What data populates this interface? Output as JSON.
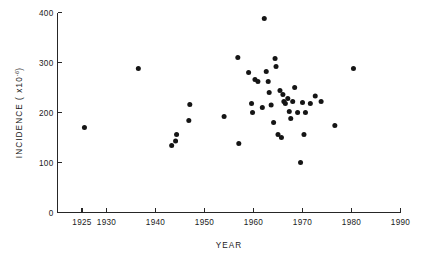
{
  "figure": {
    "background_color": "#ffffff",
    "ink_color": "#1a1a1a",
    "point_color": "#151515"
  },
  "axes": {
    "x": {
      "label": "YEAR",
      "ticks": [
        1925,
        1930,
        1940,
        1950,
        1960,
        1970,
        1980,
        1990
      ],
      "tick_labels": [
        "1925",
        "1930",
        "1940",
        "1950",
        "1960",
        "1970",
        "1980",
        "1990"
      ],
      "range": [
        1920,
        1990
      ]
    },
    "y": {
      "label_prefix": "INCIDENCE ( x10",
      "label_exponent": "-6",
      "label_suffix": ")",
      "label_full": "INCIDENCE ( x10-6 )",
      "ticks": [
        0,
        100,
        200,
        300,
        400
      ],
      "tick_labels": [
        "0",
        "100",
        "200",
        "300",
        "400"
      ],
      "range": [
        0,
        400
      ]
    }
  },
  "chart_data": {
    "type": "scatter",
    "title": "",
    "xlabel": "YEAR",
    "ylabel": "INCIDENCE ( x10-6 )",
    "xlim": [
      1920,
      1990
    ],
    "ylim": [
      0,
      400
    ],
    "grid": false,
    "legend": null,
    "marker": "filled-circle",
    "n_points": 45,
    "x": [
      1925.5,
      1936.5,
      1943.3,
      1944.1,
      1944.3,
      1946.8,
      1947.0,
      1954.0,
      1956.8,
      1957.0,
      1959.0,
      1959.6,
      1959.8,
      1960.3,
      1960.9,
      1961.8,
      1962.2,
      1962.6,
      1963.0,
      1963.2,
      1963.6,
      1964.1,
      1964.4,
      1964.6,
      1965.0,
      1965.4,
      1965.7,
      1966.0,
      1966.2,
      1966.5,
      1967.0,
      1967.3,
      1967.6,
      1968.0,
      1968.4,
      1969.0,
      1969.6,
      1970.0,
      1970.3,
      1970.6,
      1971.6,
      1972.6,
      1973.8,
      1976.6,
      1980.4
    ],
    "y": [
      170,
      288,
      134,
      143,
      156,
      184,
      216,
      192,
      310,
      138,
      280,
      218,
      200,
      266,
      262,
      210,
      388,
      282,
      262,
      240,
      215,
      180,
      308,
      292,
      156,
      244,
      150,
      236,
      222,
      218,
      228,
      202,
      188,
      222,
      250,
      200,
      100,
      220,
      156,
      200,
      218,
      233,
      222,
      174,
      288
    ],
    "points": [
      {
        "year": 1925.5,
        "incidence": 170
      },
      {
        "year": 1936.5,
        "incidence": 288
      },
      {
        "year": 1943.3,
        "incidence": 134
      },
      {
        "year": 1944.1,
        "incidence": 143
      },
      {
        "year": 1944.3,
        "incidence": 156
      },
      {
        "year": 1946.8,
        "incidence": 184
      },
      {
        "year": 1947.0,
        "incidence": 216
      },
      {
        "year": 1954.0,
        "incidence": 192
      },
      {
        "year": 1956.8,
        "incidence": 310
      },
      {
        "year": 1957.0,
        "incidence": 138
      },
      {
        "year": 1959.0,
        "incidence": 280
      },
      {
        "year": 1959.6,
        "incidence": 218
      },
      {
        "year": 1959.8,
        "incidence": 200
      },
      {
        "year": 1960.3,
        "incidence": 266
      },
      {
        "year": 1960.9,
        "incidence": 262
      },
      {
        "year": 1961.8,
        "incidence": 210
      },
      {
        "year": 1962.2,
        "incidence": 388
      },
      {
        "year": 1962.6,
        "incidence": 282
      },
      {
        "year": 1963.0,
        "incidence": 262
      },
      {
        "year": 1963.2,
        "incidence": 240
      },
      {
        "year": 1963.6,
        "incidence": 215
      },
      {
        "year": 1964.1,
        "incidence": 180
      },
      {
        "year": 1964.4,
        "incidence": 308
      },
      {
        "year": 1964.6,
        "incidence": 292
      },
      {
        "year": 1965.0,
        "incidence": 156
      },
      {
        "year": 1965.4,
        "incidence": 244
      },
      {
        "year": 1965.7,
        "incidence": 150
      },
      {
        "year": 1966.0,
        "incidence": 236
      },
      {
        "year": 1966.2,
        "incidence": 222
      },
      {
        "year": 1966.5,
        "incidence": 218
      },
      {
        "year": 1967.0,
        "incidence": 228
      },
      {
        "year": 1967.3,
        "incidence": 202
      },
      {
        "year": 1967.6,
        "incidence": 188
      },
      {
        "year": 1968.0,
        "incidence": 222
      },
      {
        "year": 1968.4,
        "incidence": 250
      },
      {
        "year": 1969.0,
        "incidence": 200
      },
      {
        "year": 1969.6,
        "incidence": 100
      },
      {
        "year": 1970.0,
        "incidence": 220
      },
      {
        "year": 1970.3,
        "incidence": 156
      },
      {
        "year": 1970.6,
        "incidence": 200
      },
      {
        "year": 1971.6,
        "incidence": 218
      },
      {
        "year": 1972.6,
        "incidence": 233
      },
      {
        "year": 1973.8,
        "incidence": 222
      },
      {
        "year": 1976.6,
        "incidence": 174
      },
      {
        "year": 1980.4,
        "incidence": 288
      }
    ]
  }
}
